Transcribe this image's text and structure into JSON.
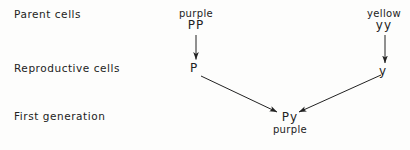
{
  "diagram": {
    "title_rows": [
      {
        "id": "parent",
        "label": "Parent cells"
      },
      {
        "id": "reproductive",
        "label": "Reproductive  cells"
      },
      {
        "id": "first_generation",
        "label": "First generation"
      }
    ],
    "parents": [
      {
        "side": "left",
        "phenotype": "purple",
        "genotype": "PP",
        "gamete": "P"
      },
      {
        "side": "right",
        "phenotype": "yellow",
        "genotype": "yy",
        "gamete": "y"
      }
    ],
    "offspring": {
      "genotype": "Py",
      "phenotype": "purple"
    },
    "colors": {
      "ink": "#222222",
      "paper": "#fdfdfc"
    }
  }
}
